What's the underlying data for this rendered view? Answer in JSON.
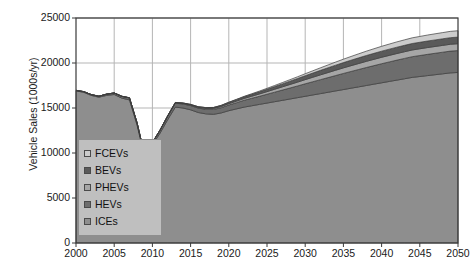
{
  "chart_data": {
    "type": "area",
    "stacked": true,
    "title": "",
    "xlabel": "",
    "ylabel": "Vehicle Sales (1000s/yr)",
    "xlim": [
      2000,
      2050
    ],
    "ylim": [
      0,
      25000
    ],
    "grid": true,
    "legend_position": "inside-left",
    "x_tick_labels": [
      "2000",
      "2005",
      "2010",
      "2015",
      "2020",
      "2025",
      "2030",
      "2035",
      "2040",
      "2045",
      "2050"
    ],
    "y_tick_labels": [
      "0",
      "5000",
      "10000",
      "15000",
      "20000",
      "25000"
    ],
    "x_ticks": [
      2000,
      2005,
      2010,
      2015,
      2020,
      2025,
      2030,
      2035,
      2040,
      2045,
      2050
    ],
    "y_ticks": [
      0,
      5000,
      10000,
      15000,
      20000,
      25000
    ],
    "x": [
      2000,
      2001,
      2002,
      2003,
      2004,
      2005,
      2006,
      2007,
      2008,
      2009,
      2010,
      2011,
      2012,
      2013,
      2014,
      2015,
      2016,
      2017,
      2018,
      2019,
      2020,
      2021,
      2022,
      2023,
      2024,
      2025,
      2026,
      2027,
      2028,
      2029,
      2030,
      2031,
      2032,
      2033,
      2034,
      2035,
      2036,
      2037,
      2038,
      2039,
      2040,
      2041,
      2042,
      2043,
      2044,
      2045,
      2046,
      2047,
      2048,
      2049,
      2050
    ],
    "series": [
      {
        "name": "ICEs",
        "color": "#8e8e8e",
        "values": [
          16900,
          16750,
          16400,
          16200,
          16400,
          16500,
          16100,
          15900,
          13100,
          9500,
          10900,
          12200,
          13700,
          15100,
          15000,
          14800,
          14500,
          14350,
          14300,
          14450,
          14700,
          14900,
          15100,
          15250,
          15400,
          15550,
          15700,
          15850,
          16000,
          16150,
          16300,
          16450,
          16600,
          16750,
          16900,
          17050,
          17200,
          17350,
          17500,
          17650,
          17800,
          17950,
          18100,
          18250,
          18400,
          18500,
          18600,
          18700,
          18800,
          18900,
          18950
        ]
      },
      {
        "name": "HEVs",
        "color": "#6d6d6d",
        "values": [
          60,
          70,
          90,
          110,
          140,
          170,
          200,
          230,
          230,
          200,
          260,
          320,
          380,
          430,
          450,
          470,
          490,
          510,
          540,
          580,
          630,
          690,
          760,
          830,
          900,
          980,
          1060,
          1140,
          1220,
          1300,
          1390,
          1470,
          1550,
          1630,
          1710,
          1790,
          1860,
          1930,
          2000,
          2060,
          2120,
          2170,
          2220,
          2260,
          2300,
          2330,
          2360,
          2380,
          2400,
          2420,
          2430
        ]
      },
      {
        "name": "PHEVs",
        "color": "#a6a6a6",
        "values": [
          0,
          0,
          0,
          0,
          0,
          0,
          0,
          0,
          0,
          0,
          10,
          20,
          35,
          50,
          60,
          70,
          80,
          95,
          110,
          130,
          150,
          175,
          200,
          230,
          260,
          290,
          325,
          360,
          395,
          430,
          465,
          500,
          535,
          565,
          595,
          620,
          645,
          665,
          685,
          700,
          715,
          725,
          735,
          742,
          748,
          752,
          756,
          758,
          760,
          762,
          763
        ]
      },
      {
        "name": "BEVs",
        "color": "#5a5a5a",
        "values": [
          0,
          0,
          0,
          0,
          0,
          0,
          0,
          0,
          0,
          0,
          5,
          12,
          22,
          35,
          45,
          55,
          68,
          82,
          98,
          116,
          136,
          158,
          182,
          208,
          236,
          266,
          298,
          330,
          364,
          398,
          432,
          466,
          498,
          528,
          556,
          582,
          606,
          628,
          648,
          665,
          680,
          692,
          702,
          710,
          716,
          721,
          725,
          728,
          730,
          732,
          733
        ]
      },
      {
        "name": "FCEVs",
        "color": "#cccccc",
        "values": [
          0,
          0,
          0,
          0,
          0,
          0,
          0,
          0,
          0,
          0,
          0,
          0,
          0,
          0,
          2,
          4,
          7,
          11,
          16,
          22,
          30,
          40,
          52,
          66,
          82,
          100,
          120,
          142,
          166,
          192,
          220,
          250,
          282,
          315,
          348,
          382,
          415,
          448,
          480,
          510,
          538,
          564,
          588,
          610,
          630,
          648,
          664,
          678,
          690,
          700,
          708
        ]
      }
    ]
  },
  "legend": {
    "items": [
      {
        "label": "FCEVs",
        "color": "#cccccc"
      },
      {
        "label": "BEVs",
        "color": "#5a5a5a"
      },
      {
        "label": "PHEVs",
        "color": "#a6a6a6"
      },
      {
        "label": "HEVs",
        "color": "#6d6d6d"
      },
      {
        "label": "ICEs",
        "color": "#8e8e8e"
      }
    ]
  },
  "axes": {
    "y_title": "Vehicle Sales (1000s/yr)"
  },
  "style": {
    "plot_bg": "#ffffff",
    "grid_color": "#b5b5b5",
    "axis_color": "#3a3a3a",
    "text_color": "#1a1a1a"
  }
}
